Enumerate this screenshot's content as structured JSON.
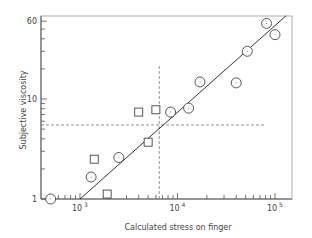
{
  "chart_data": {
    "type": "scatter",
    "title": "",
    "xlabel": "Calculated stress on finger",
    "ylabel": "Subjective viscosity",
    "xscale": "log",
    "yscale": "log",
    "xlim": [
      400,
      150000
    ],
    "ylim": [
      1,
      60
    ],
    "x_ticks": [
      {
        "value": 1000,
        "label": "10",
        "exp": "3"
      },
      {
        "value": 10000,
        "label": "10",
        "exp": "4"
      },
      {
        "value": 100000,
        "label": "10",
        "exp": "5"
      }
    ],
    "y_ticks": [
      {
        "value": 1,
        "label": "1"
      },
      {
        "value": 10,
        "label": "10"
      },
      {
        "value": 60,
        "label": "60"
      }
    ],
    "grid": false,
    "legend": null,
    "series": [
      {
        "name": "circles",
        "marker": "circle",
        "points": [
          [
            500,
            1.0
          ],
          [
            1300,
            1.66
          ],
          [
            2500,
            2.6
          ],
          [
            8500,
            7.4
          ],
          [
            13000,
            8.1
          ],
          [
            17000,
            14.8
          ],
          [
            40000,
            14.5
          ],
          [
            52000,
            30
          ],
          [
            82000,
            57
          ],
          [
            100000,
            44
          ]
        ]
      },
      {
        "name": "squares",
        "marker": "square",
        "points": [
          [
            1400,
            2.5
          ],
          [
            1900,
            1.12
          ],
          [
            4000,
            7.4
          ],
          [
            6000,
            7.8
          ],
          [
            5000,
            3.7
          ]
        ]
      }
    ],
    "fit_line": {
      "from": [
        1000,
        1.0
      ],
      "to": [
        130000,
        68
      ]
    },
    "reference_lines": {
      "vertical_x": 6500,
      "horizontal_y": 5.5,
      "style": "dashed"
    }
  }
}
